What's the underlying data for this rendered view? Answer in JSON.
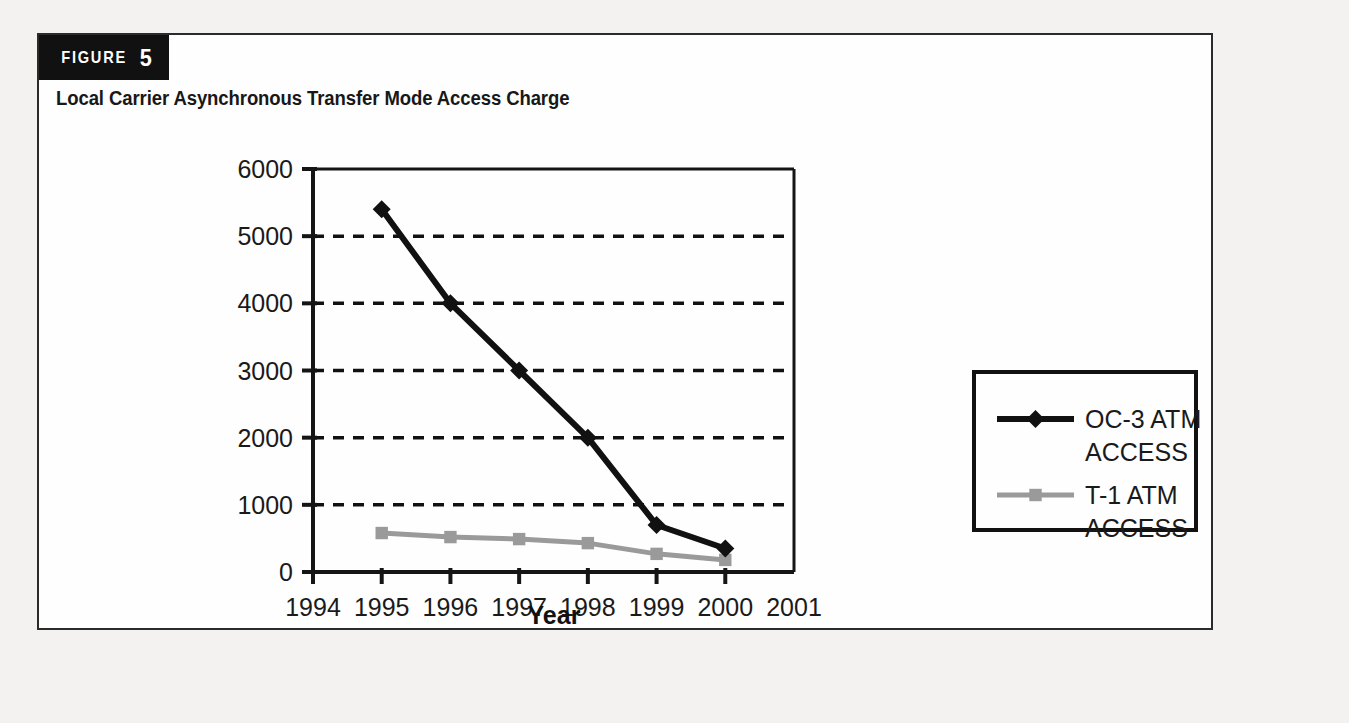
{
  "figure": {
    "tag_word": "FIGURE",
    "tag_number": "5",
    "subtitle": "Local Carrier Asynchronous Transfer Mode Access Charge"
  },
  "chart_data": {
    "type": "line",
    "title": "Local Carrier Asynchronous Transfer Mode Access Charge",
    "xlabel": "Year",
    "ylabel": "",
    "x": [
      1995,
      1996,
      1997,
      1998,
      1999,
      2000
    ],
    "xtick_labels": [
      "1994",
      "1995",
      "1996",
      "1997",
      "1998",
      "1999",
      "2000",
      "2001"
    ],
    "ytick_labels": [
      "0",
      "1000",
      "2000",
      "3000",
      "4000",
      "5000",
      "6000"
    ],
    "xlim": [
      1994,
      2001
    ],
    "ylim": [
      0,
      6000
    ],
    "grid": "horizontal-dashed",
    "legend_position": "right-outside",
    "series": [
      {
        "name": "OC-3 ATM ACCESS",
        "color": "#111111",
        "marker": "diamond",
        "values": [
          5400,
          4000,
          3000,
          2000,
          700,
          350
        ]
      },
      {
        "name": "T-1 ATM ACCESS",
        "color": "#9a9a9a",
        "marker": "square",
        "values": [
          580,
          520,
          490,
          430,
          270,
          180
        ]
      }
    ]
  },
  "legend": {
    "entries": [
      {
        "line1": "OC-3 ATM",
        "line2": "ACCESS"
      },
      {
        "line1": "T-1 ATM",
        "line2": "ACCESS"
      }
    ]
  },
  "colors": {
    "series_primary": "#111111",
    "series_secondary": "#9a9a9a",
    "axis": "#151515",
    "panel_background": "#fefefe",
    "page_background": "#f3f2f0"
  }
}
